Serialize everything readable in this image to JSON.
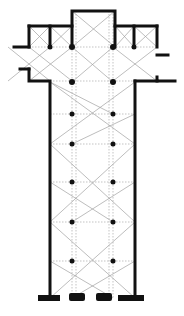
{
  "diagram": {
    "type": "architectural floor plan",
    "colors": {
      "wall": "#111111",
      "vault_lines": "#9a9a9a",
      "background": "#ffffff"
    },
    "choir": {
      "x1": 72,
      "x2": 115,
      "y_top": 11
    },
    "transept": {
      "x1": 29,
      "x2": 157,
      "y_top": 26,
      "y_bottom": 81
    },
    "nave": {
      "x1": 50,
      "x2": 135,
      "y_top": 81,
      "y_bottom": 298
    },
    "pier_columns_x": [
      72,
      113
    ],
    "pier_rows_y": [
      47,
      82,
      114,
      144,
      182,
      222,
      261
    ]
  }
}
